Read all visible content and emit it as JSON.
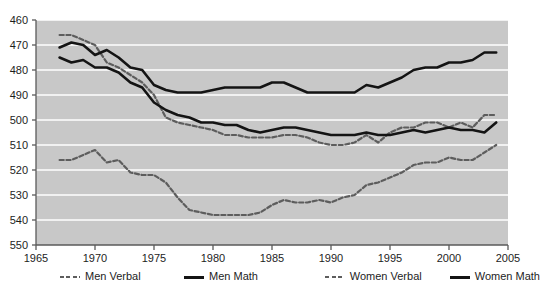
{
  "chart_data": {
    "type": "line",
    "title": "",
    "subtitle": "",
    "xlabel": "",
    "ylabel": "",
    "xlim": [
      1965,
      2005
    ],
    "ylim": [
      460,
      550
    ],
    "xticks": [
      1965,
      1970,
      1975,
      1980,
      1985,
      1990,
      1995,
      2000,
      2005
    ],
    "yticks": [
      460,
      470,
      480,
      490,
      500,
      510,
      520,
      530,
      540,
      550
    ],
    "grid": "horizontal-white-gridlines",
    "legend_position": "below-axes",
    "plot_background": "#c8c8c8",
    "x": [
      1967,
      1968,
      1969,
      1970,
      1971,
      1972,
      1973,
      1974,
      1975,
      1976,
      1977,
      1978,
      1979,
      1980,
      1981,
      1982,
      1983,
      1984,
      1985,
      1986,
      1987,
      1988,
      1989,
      1990,
      1991,
      1992,
      1993,
      1994,
      1995,
      1996,
      1997,
      1998,
      1999,
      2000,
      2001,
      2002,
      2003,
      2004
    ],
    "series": [
      {
        "name": "Men Verbal",
        "style": "dashed",
        "color": "#5d5d5d",
        "values": [
          544,
          544,
          542,
          540,
          533,
          531,
          528,
          525,
          520,
          511,
          509,
          508,
          507,
          506,
          504,
          504,
          503,
          503,
          503,
          504,
          504,
          503,
          501,
          500,
          500,
          501,
          504,
          501,
          505,
          507,
          507,
          509,
          509,
          507,
          509,
          507,
          512,
          512
        ]
      },
      {
        "name": "Men Math",
        "style": "solid",
        "color": "#141414",
        "values": [
          539,
          541,
          540,
          536,
          538,
          535,
          531,
          530,
          524,
          522,
          521,
          521,
          521,
          522,
          523,
          523,
          523,
          523,
          525,
          525,
          523,
          521,
          521,
          521,
          521,
          521,
          524,
          523,
          525,
          527,
          530,
          531,
          531,
          533,
          533,
          534,
          537,
          537
        ]
      },
      {
        "name": "Women Verbal",
        "style": "dashed",
        "color": "#5d5d5d",
        "values": [
          494,
          494,
          496,
          498,
          493,
          494,
          489,
          488,
          488,
          485,
          479,
          474,
          473,
          472,
          472,
          472,
          472,
          473,
          476,
          478,
          477,
          477,
          478,
          477,
          479,
          480,
          484,
          485,
          487,
          489,
          492,
          493,
          493,
          495,
          494,
          494,
          497,
          500
        ]
      },
      {
        "name": "Women Math",
        "style": "solid",
        "color": "#141414",
        "values": [
          535,
          533,
          534,
          531,
          531,
          529,
          525,
          523,
          517,
          514,
          512,
          511,
          509,
          509,
          508,
          508,
          506,
          505,
          506,
          507,
          507,
          506,
          505,
          504,
          504,
          504,
          505,
          504,
          504,
          505,
          506,
          505,
          506,
          507,
          506,
          506,
          505,
          509
        ]
      }
    ]
  },
  "legend": {
    "items": [
      {
        "label": "Men Verbal",
        "style": "dashed",
        "swatch": "dashed-line-swatch"
      },
      {
        "label": "Men Math",
        "style": "solid",
        "swatch": "solid-line-swatch"
      },
      {
        "label": "Women Verbal",
        "style": "dashed",
        "swatch": "dashed-line-swatch"
      },
      {
        "label": "Women Math",
        "style": "solid",
        "swatch": "solid-line-swatch"
      }
    ]
  },
  "axes": {
    "y_tick_labels": [
      "550",
      "540",
      "530",
      "520",
      "510",
      "500",
      "490",
      "480",
      "470",
      "460"
    ],
    "x_tick_labels": [
      "1965",
      "1970",
      "1975",
      "1980",
      "1985",
      "1990",
      "1995",
      "2000",
      "2005"
    ]
  }
}
